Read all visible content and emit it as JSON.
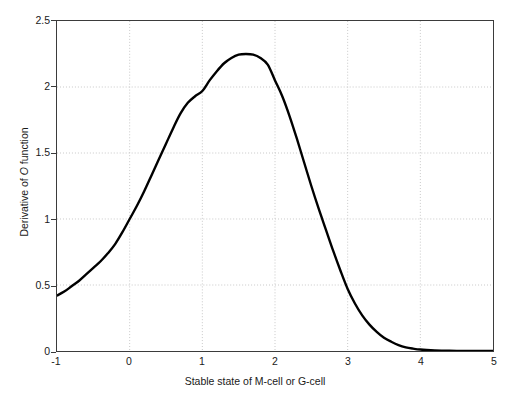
{
  "chart_data": {
    "type": "line",
    "title": "",
    "xlabel": "Stable state of M-cell or G-cell",
    "ylabel_prefix": "Derivative of ",
    "ylabel_italic": "O",
    "ylabel_suffix": " function",
    "ylabel_full": "Derivative of O function",
    "xlim": [
      -1,
      5
    ],
    "ylim": [
      0,
      2.5
    ],
    "xticks": [
      -1,
      0,
      1,
      2,
      3,
      4,
      5
    ],
    "xtick_labels": [
      "-1",
      "0",
      "1",
      "2",
      "3",
      "4",
      "5"
    ],
    "yticks": [
      0,
      0.5,
      1,
      1.5,
      2,
      2.5
    ],
    "ytick_labels": [
      "0",
      "0.5",
      "1",
      "1.5",
      "2",
      "2.5"
    ],
    "grid": true,
    "grid_style": "dotted",
    "grid_color": "#c8c8c8",
    "legend": "none",
    "line_color": "#000000",
    "line_width": 2.4,
    "series": [
      {
        "name": "Derivative of O function",
        "x": [
          -1.0,
          -0.9,
          -0.8,
          -0.7,
          -0.6,
          -0.5,
          -0.4,
          -0.3,
          -0.2,
          -0.1,
          0.0,
          0.1,
          0.2,
          0.3,
          0.4,
          0.5,
          0.6,
          0.7,
          0.8,
          0.9,
          1.0,
          1.1,
          1.2,
          1.3,
          1.4,
          1.5,
          1.6,
          1.7,
          1.8,
          1.9,
          2.0,
          2.1,
          2.2,
          2.3,
          2.4,
          2.5,
          2.6,
          2.7,
          2.8,
          2.9,
          3.0,
          3.1,
          3.2,
          3.3,
          3.4,
          3.5,
          3.6,
          3.7,
          3.8,
          3.9,
          4.0,
          4.2,
          4.4,
          4.6,
          4.8,
          5.0
        ],
        "y": [
          0.42,
          0.45,
          0.49,
          0.53,
          0.58,
          0.63,
          0.68,
          0.74,
          0.81,
          0.9,
          1.0,
          1.1,
          1.21,
          1.33,
          1.45,
          1.57,
          1.69,
          1.8,
          1.88,
          1.93,
          1.97,
          2.05,
          2.12,
          2.18,
          2.22,
          2.245,
          2.25,
          2.245,
          2.22,
          2.17,
          2.05,
          1.93,
          1.78,
          1.61,
          1.43,
          1.25,
          1.08,
          0.92,
          0.76,
          0.61,
          0.47,
          0.36,
          0.27,
          0.2,
          0.145,
          0.1,
          0.07,
          0.045,
          0.028,
          0.018,
          0.011,
          0.005,
          0.002,
          0.001,
          0.0005,
          0.0
        ]
      }
    ]
  },
  "axes": {
    "box_color": "#3b3b3b"
  }
}
